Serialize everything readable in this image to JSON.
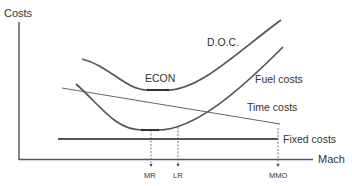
{
  "diagram": {
    "y_axis_label": "Costs",
    "x_axis_label": "Mach",
    "curves": {
      "doc": {
        "label": "D.O.C."
      },
      "fuel": {
        "label": "Fuel costs"
      },
      "time": {
        "label": "Time costs"
      },
      "fixed": {
        "label": "Fixed costs"
      }
    },
    "econ_label": "ECON",
    "markers": [
      {
        "label": "MR"
      },
      {
        "label": "LR"
      },
      {
        "label": "MMO"
      }
    ],
    "colors": {
      "curve": "#555555",
      "axis": "#444444",
      "text": "#333333"
    }
  }
}
